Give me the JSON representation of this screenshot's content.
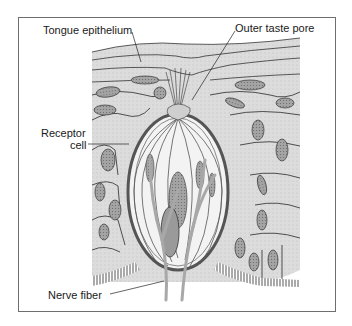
{
  "figure": {
    "labels": {
      "tongue_epithelium": "Tongue epithelium",
      "outer_taste_pore": "Outer taste pore",
      "receptor_cell_line1": "Receptor",
      "receptor_cell_line2": "cell",
      "nerve_fiber": "Nerve fiber"
    },
    "colors": {
      "frame": "#6e6e6e",
      "tissue_fill": "#d9d9d9",
      "cell_outline": "#2a2a2a",
      "nucleus_fill": "#9a9a9a",
      "bud_outer": "#7a7a7a",
      "nerve": "#a8a8a8",
      "background": "#ffffff"
    }
  }
}
